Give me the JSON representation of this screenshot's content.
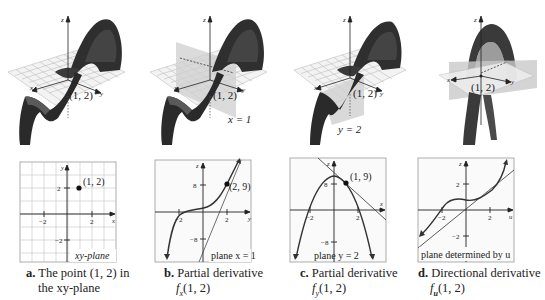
{
  "figure": {
    "panels": [
      {
        "id": "a",
        "surface_label": "(1, 2)",
        "surface_axes": [
          "z",
          "x",
          "y"
        ],
        "plot_axes": {
          "horizontal": "x",
          "vertical": "y"
        },
        "ticks_h": [
          "−2",
          "2"
        ],
        "ticks_v": [
          "2",
          "−2"
        ],
        "point_label": "(1, 2)",
        "plane_label": "xy-plane",
        "caption_letter": "a.",
        "caption_line1": "The point (1, 2) in",
        "caption_line2": "the xy-plane"
      },
      {
        "id": "b",
        "surface_label": "(1, 2)",
        "surface_axes": [
          "z",
          "x",
          "y"
        ],
        "surface_plane_label": "x = 1",
        "plot_axes": {
          "horizontal": "y",
          "vertical": "z"
        },
        "ticks_h": [
          "−2",
          "2"
        ],
        "ticks_v": [
          "8",
          "−8"
        ],
        "point_label": "(2, 9)",
        "plane_label": "plane x = 1",
        "caption_letter": "b.",
        "caption_line1": "Partial derivative",
        "caption_line2": "fx(1, 2)",
        "caption_func": "f",
        "caption_sub": "x",
        "caption_args": "(1, 2)"
      },
      {
        "id": "c",
        "surface_label": "(1, 2)",
        "surface_axes": [
          "z",
          "x",
          "y"
        ],
        "surface_plane_label": "y = 2",
        "plot_axes": {
          "horizontal": "x",
          "vertical": "z"
        },
        "ticks_h": [
          "−2",
          "2"
        ],
        "ticks_v": [
          "8",
          "−8"
        ],
        "point_label": "(1, 9)",
        "plane_label": "plane y = 2",
        "caption_letter": "c.",
        "caption_line1": "Partial derivative",
        "caption_line2": "fy(1, 2)",
        "caption_func": "f",
        "caption_sub": "y",
        "caption_args": "(1, 2)"
      },
      {
        "id": "d",
        "surface_label": "(1, 2)",
        "surface_axes": [
          "z",
          "x",
          "y"
        ],
        "plot_axes": {
          "horizontal": "u",
          "vertical": "z"
        },
        "ticks_h": [
          "−2",
          "2"
        ],
        "ticks_v": [
          "2",
          "−2"
        ],
        "plane_label": "plane determined by u",
        "caption_letter": "d.",
        "caption_line1": "Directional derivative",
        "caption_line2": "fu(1, 2)",
        "caption_func": "f",
        "caption_sub": "u",
        "caption_args": "(1, 2)"
      }
    ],
    "colors": {
      "surface_dark": "#2a2a2a",
      "surface_mid": "#555555",
      "grid": "#bdbdbd",
      "plane": "#c8c8c8",
      "axis": "#222222",
      "frame": "#9a9a9a"
    }
  }
}
